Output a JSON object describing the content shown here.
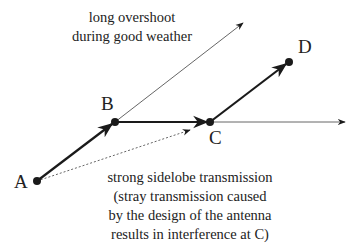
{
  "points": {
    "A": {
      "label": "A"
    },
    "B": {
      "label": "B"
    },
    "C": {
      "label": "C"
    },
    "D": {
      "label": "D"
    }
  },
  "annotations": {
    "overshoot": [
      "long overshoot",
      "during good weather"
    ],
    "sidelobe": [
      "strong sidelobe transmission",
      "(stray transmission caused",
      "by the design of the antenna",
      "results in interference at C)"
    ]
  },
  "edges": [
    {
      "from": "A",
      "to": "B",
      "style": "thick"
    },
    {
      "from": "B",
      "to": "C",
      "style": "thick"
    },
    {
      "from": "C",
      "to": "D",
      "style": "thick"
    },
    {
      "from": "B",
      "to": "overshoot",
      "style": "thin"
    },
    {
      "from": "C",
      "to": "beyond",
      "style": "thin"
    },
    {
      "from": "A",
      "to": "near-C",
      "style": "dotted"
    }
  ],
  "colors": {
    "ink": "#1a1a1a",
    "thin": "#444444"
  }
}
